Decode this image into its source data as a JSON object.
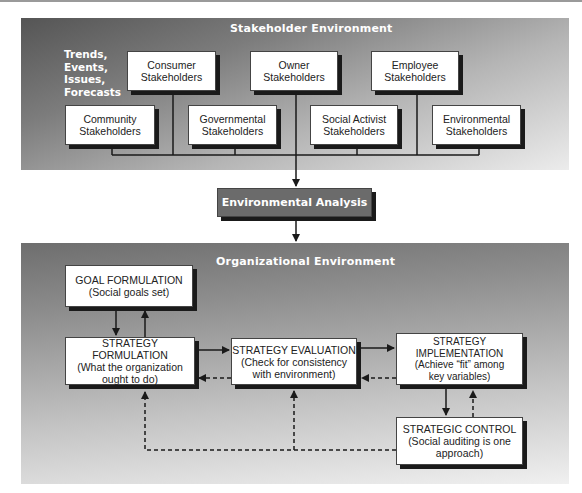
{
  "diagram": {
    "stakeholder_environment": {
      "title": "Stakeholder Environment",
      "side_label": [
        "Trends,",
        "Events,",
        "Issues,",
        "Forecasts"
      ],
      "stakeholders": [
        {
          "line1": "Consumer",
          "line2": "Stakeholders"
        },
        {
          "line1": "Owner",
          "line2": "Stakeholders"
        },
        {
          "line1": "Employee",
          "line2": "Stakeholders"
        },
        {
          "line1": "Community",
          "line2": "Stakeholders"
        },
        {
          "line1": "Governmental",
          "line2": "Stakeholders"
        },
        {
          "line1": "Social Activist",
          "line2": "Stakeholders"
        },
        {
          "line1": "Environmental",
          "line2": "Stakeholders"
        }
      ]
    },
    "environmental_analysis": {
      "label": "Environmental Analysis"
    },
    "organizational_environment": {
      "title": "Organizational Environment",
      "goal_formulation": {
        "line1": "GOAL FORMULATION",
        "line2": "(Social goals set)"
      },
      "strategy_formulation": {
        "line1": "STRATEGY FORMULATION",
        "line2": "(What the organization",
        "line3": "ought to do)"
      },
      "strategy_evaluation": {
        "line1": "STRATEGY EVALUATION",
        "line2": "(Check for consistency",
        "line3": "with environment)"
      },
      "strategy_implementation": {
        "line1": "STRATEGY",
        "line2": "IMPLEMENTATION",
        "line3": "(Achieve “fit” among",
        "line4": "key variables)"
      },
      "strategic_control": {
        "line1": "STRATEGIC CONTROL",
        "line2": "(Social auditing is one",
        "line3": "approach)"
      }
    }
  }
}
